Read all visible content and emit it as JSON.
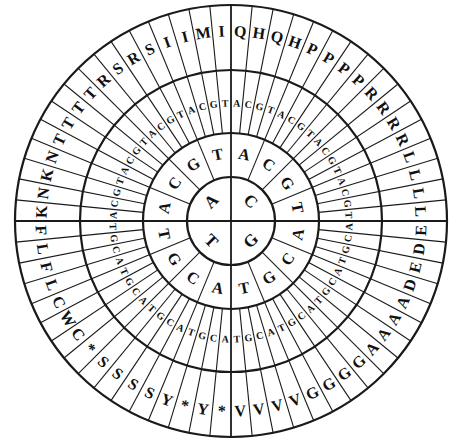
{
  "geometry": {
    "cx": 231,
    "cy": 221,
    "radii": [
      44,
      88,
      151,
      216
    ],
    "label_radii": [
      26,
      68,
      118,
      190
    ]
  },
  "quadrants": [
    {
      "base": "C",
      "start_deg": 0
    },
    {
      "base": "G",
      "start_deg": 90
    },
    {
      "base": "T",
      "start_deg": 180
    },
    {
      "base": "A",
      "start_deg": 270
    }
  ],
  "second_ring_order": [
    "A",
    "C",
    "G",
    "T"
  ],
  "third_ring_order": [
    "A",
    "C",
    "G",
    "T"
  ],
  "amino_acids": {
    "C": [
      "Q",
      "H",
      "Q",
      "H",
      "P",
      "P",
      "P",
      "P",
      "R",
      "R",
      "R",
      "R",
      "L",
      "L",
      "L",
      "L"
    ],
    "G": [
      "E",
      "D",
      "E",
      "D",
      "A",
      "A",
      "A",
      "A",
      "G",
      "G",
      "G",
      "G",
      "V",
      "V",
      "V",
      "V"
    ],
    "T": [
      "*",
      "Y",
      "*",
      "Y",
      "S",
      "S",
      "S",
      "S",
      "*",
      "C",
      "W",
      "C",
      "L",
      "F",
      "L",
      "F"
    ],
    "A": [
      "K",
      "N",
      "K",
      "N",
      "T",
      "T",
      "T",
      "T",
      "R",
      "S",
      "R",
      "S",
      "I",
      "I",
      "M",
      "I"
    ]
  },
  "colors": {
    "line": "#1a1a1a",
    "text": "#111111",
    "background": "#ffffff"
  }
}
